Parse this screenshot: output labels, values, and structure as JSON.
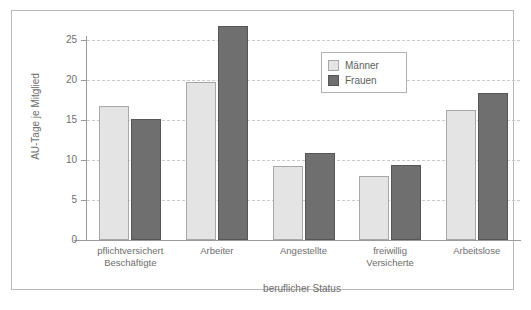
{
  "chart_data": {
    "type": "bar",
    "title": "",
    "xlabel": "beruflicher Status",
    "ylabel": "AU-Tage je Mitglied",
    "ylim": [
      0,
      27.5
    ],
    "yticks": [
      0,
      5,
      10,
      15,
      20,
      25
    ],
    "grid": true,
    "legend_position": "upper center",
    "categories": [
      "pflichtversichert\nBeschäftigte",
      "Arbeiter",
      "Angestellte",
      "freiwillig\nVersicherte",
      "Arbeitslose"
    ],
    "series": [
      {
        "name": "Männer",
        "color": "#e4e4e4",
        "values": [
          16.8,
          19.7,
          9.2,
          8.0,
          16.3
        ]
      },
      {
        "name": "Frauen",
        "color": "#6f6f6f",
        "values": [
          15.1,
          26.8,
          10.9,
          9.4,
          18.4
        ]
      }
    ]
  },
  "axis": {
    "y_tick_labels": [
      "0",
      "5",
      "10",
      "15",
      "20",
      "25"
    ],
    "y_title": "AU-Tage je Mitglied",
    "x_title": "beruflicher Status"
  },
  "legend": {
    "items": [
      {
        "label": "Männer",
        "key": "maenner"
      },
      {
        "label": "Frauen",
        "key": "frauen"
      }
    ]
  }
}
